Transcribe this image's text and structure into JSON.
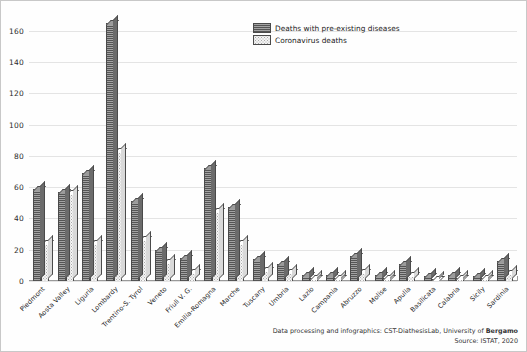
{
  "legend": {
    "position": "top-right",
    "items": [
      {
        "label": "Deaths with pre-existing diseases",
        "pattern": "dark-hatched",
        "color": "#8a8a8a"
      },
      {
        "label": "Coronavirus deaths",
        "pattern": "light-dotted",
        "color": "#f4f4f4"
      }
    ]
  },
  "footer": {
    "line1_prefix": "Data processing and infographics: CST-DiathesisLab, University of ",
    "line1_bold": "Bergamo",
    "line2": "Source: ISTAT, 2020"
  },
  "chart_data": {
    "type": "bar",
    "title": "",
    "subtitle": "",
    "xlabel": "",
    "ylabel": "",
    "ylim": [
      0,
      170
    ],
    "yticks": [
      0,
      20,
      40,
      60,
      80,
      100,
      120,
      140,
      160
    ],
    "grid": true,
    "legend_position": "top-right",
    "categories": [
      "Piedmont",
      "Aosta Valley",
      "Liguria",
      "Lombardy",
      "Trentino-S. Tyrol",
      "Veneto",
      "Friuli V. G.",
      "Emilia-Romagna",
      "Marche",
      "Tuscany",
      "Umbria",
      "Lazio",
      "Campania",
      "Abruzzo",
      "Molise",
      "Apulia",
      "Basilicata",
      "Calabria",
      "Sicily",
      "Sardinia"
    ],
    "series": [
      {
        "name": "Deaths with pre-existing diseases",
        "values": [
          59,
          57,
          69,
          165,
          51,
          20,
          15,
          72,
          47,
          14,
          11,
          4,
          4,
          16,
          4,
          11,
          3,
          4,
          3,
          13
        ]
      },
      {
        "name": "Coronavirus deaths",
        "values": [
          24,
          56,
          24,
          83,
          27,
          12,
          6,
          45,
          24,
          7,
          6,
          2,
          2,
          6,
          2,
          4,
          1,
          2,
          2,
          5
        ]
      }
    ]
  }
}
